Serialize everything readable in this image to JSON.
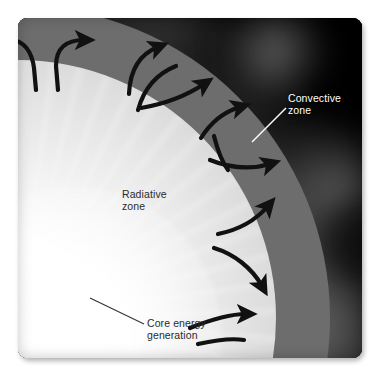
{
  "figure": {
    "kind": "annotated-diagram",
    "plate": {
      "background_description": "dark space with faint corona"
    }
  },
  "labels": {
    "convective": {
      "text": "Convective\nzone",
      "color": "#ffffff",
      "leader": "white"
    },
    "radiative": {
      "text": "Radiative\nzone",
      "color": "#2b2b2b",
      "leader": "none"
    },
    "core": {
      "text": "Core energy\ngeneration",
      "color": "#2b2b2b",
      "leader": "dark"
    }
  },
  "regions": [
    {
      "name": "core",
      "label": "Core energy generation",
      "color": "#ffffff"
    },
    {
      "name": "radiative-zone",
      "label": "Radiative zone",
      "color": "#dcdcdc"
    },
    {
      "name": "convective-zone",
      "label": "Convective zone",
      "color": "#6d6d6d"
    },
    {
      "name": "photosphere",
      "label": "",
      "color": "#f8f8f8"
    },
    {
      "name": "space",
      "label": "",
      "color": "#0a0a0a"
    }
  ],
  "colors": {
    "core": "#ffffff",
    "radiative_zone": "#dcdcdc",
    "convective_zone": "#6d6d6d",
    "photosphere_rim": "#f8f8f8",
    "space": "#0a0a0a",
    "arrow": "#111111",
    "label_light": "#ffffff",
    "label_dark": "#2b2b2b",
    "plate_margin": "#ffffff"
  },
  "annotations": {
    "arrow_count": 9,
    "arrow_meaning": "convection cell circulation"
  }
}
